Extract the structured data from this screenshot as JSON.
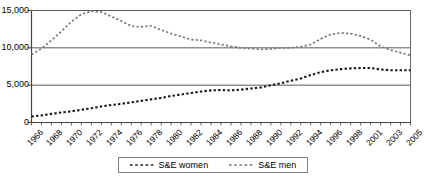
{
  "chart_data": {
    "type": "line",
    "title": "",
    "xlabel": "",
    "ylabel": "",
    "ylim": [
      0,
      15000
    ],
    "yticks": [
      0,
      5000,
      10000,
      15000
    ],
    "ytick_labels": [
      "0",
      "5,000",
      "10,000",
      "15,000"
    ],
    "grid": true,
    "grid_axis": "y",
    "legend_position": "bottom",
    "x": [
      1966,
      1967,
      1968,
      1969,
      1970,
      1971,
      1972,
      1973,
      1974,
      1975,
      1976,
      1977,
      1978,
      1979,
      1980,
      1981,
      1982,
      1983,
      1984,
      1985,
      1986,
      1987,
      1988,
      1989,
      1990,
      1991,
      1992,
      1993,
      1994,
      1995,
      1996,
      1997,
      1998,
      1999,
      2001,
      2002,
      2003,
      2004,
      2005
    ],
    "xtick_labels": [
      "1966",
      "1968",
      "1970",
      "1972",
      "1974",
      "1976",
      "1978",
      "1980",
      "1982",
      "1984",
      "1986",
      "1988",
      "1990",
      "1992",
      "1994",
      "1996",
      "1998",
      "2001",
      "2003",
      "2005"
    ],
    "xticks": [
      1966,
      1968,
      1970,
      1972,
      1974,
      1976,
      1978,
      1980,
      1982,
      1984,
      1986,
      1988,
      1990,
      1992,
      1994,
      1996,
      1998,
      2001,
      2003,
      2005
    ],
    "series": [
      {
        "name": "S&E women",
        "style": "dashed",
        "color": "#1a1a1a",
        "values": [
          800,
          950,
          1150,
          1350,
          1500,
          1700,
          1900,
          2150,
          2350,
          2500,
          2700,
          2900,
          3100,
          3300,
          3550,
          3750,
          3950,
          4150,
          4300,
          4350,
          4300,
          4400,
          4550,
          4700,
          5000,
          5250,
          5600,
          5900,
          6350,
          6750,
          7000,
          7150,
          7250,
          7300,
          7300,
          7100,
          7000,
          7000,
          7000
        ]
      },
      {
        "name": "S&E men",
        "style": "dashed",
        "color": "#777777",
        "values": [
          9100,
          9900,
          11000,
          12200,
          13500,
          14500,
          14900,
          14800,
          14200,
          13600,
          12900,
          12800,
          12950,
          12400,
          11900,
          11500,
          11100,
          11000,
          10700,
          10450,
          10200,
          10000,
          9900,
          9800,
          9850,
          10000,
          10000,
          10150,
          10450,
          11200,
          11800,
          12000,
          11900,
          11600,
          11100,
          10200,
          9700,
          9350,
          9000
        ]
      }
    ]
  },
  "legend": {
    "items": [
      {
        "label": "S&E women"
      },
      {
        "label": "S&E men"
      }
    ]
  },
  "axes": {
    "y_labels": [
      "15,000",
      "10,000",
      "5,000",
      "0"
    ],
    "x_labels": [
      "1966",
      "1968",
      "1970",
      "1972",
      "1974",
      "1976",
      "1978",
      "1980",
      "1982",
      "1984",
      "1986",
      "1988",
      "1990",
      "1992",
      "1994",
      "1996",
      "1998",
      "2001",
      "2003",
      "2005"
    ]
  }
}
